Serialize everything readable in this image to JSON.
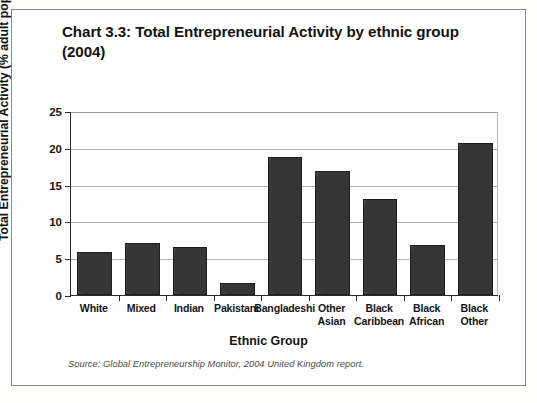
{
  "figure": {
    "title": "Chart 3.3: Total Entrepreneurial Activity by ethnic group (2004)",
    "source_note": "Source: Global Entrepreneurship Monitor, 2004 United Kingdom report.",
    "bar_color": "#3c3c3c",
    "bar_outline_color": "#1d1d1d",
    "gridline_color": "#b5b5b0",
    "axis_color": "#2b2b2b",
    "background_color": "#fefefe",
    "frame_border_color": "#8a8a85"
  },
  "chart_data": {
    "type": "bar",
    "title": "Chart 3.3: Total Entrepreneurial Activity by ethnic group (2004)",
    "xlabel": "Ethnic Group",
    "ylabel": "Total Entrepreneurial Activity (% adult population)",
    "categories": [
      "White",
      "Mixed",
      "Indian",
      "Pakistani",
      "Bangladeshi",
      "Other Asian",
      "Black Caribbean",
      "Black African",
      "Black Other"
    ],
    "category_lines": [
      [
        "White"
      ],
      [
        "Mixed"
      ],
      [
        "Indian"
      ],
      [
        "Pakistani"
      ],
      [
        "Bangladeshi"
      ],
      [
        "Other",
        "Asian"
      ],
      [
        "Black",
        "Caribbean"
      ],
      [
        "Black",
        "African"
      ],
      [
        "Black",
        "Other"
      ]
    ],
    "values": [
      5.9,
      7.1,
      6.5,
      1.6,
      18.7,
      16.9,
      13.1,
      6.8,
      20.7
    ],
    "ylim": [
      0,
      25
    ],
    "ytick_values": [
      0,
      5,
      10,
      15,
      20,
      25
    ],
    "ytick_labels": [
      "0",
      "5",
      "10",
      "15",
      "20",
      "25"
    ],
    "grid": true,
    "grid_axis": "y",
    "legend": false,
    "legend_position": "none",
    "series": [
      {
        "name": "Total Entrepreneurial Activity",
        "values": [
          5.9,
          7.1,
          6.5,
          1.6,
          18.7,
          16.9,
          13.1,
          6.8,
          20.7
        ]
      }
    ]
  }
}
